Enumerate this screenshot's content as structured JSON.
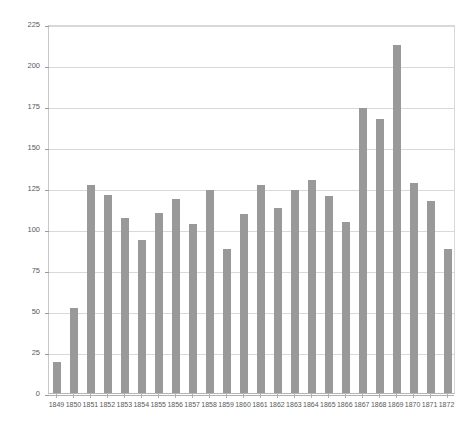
{
  "chart_data": {
    "type": "bar",
    "title": "",
    "subtitle": "",
    "xlabel": "",
    "ylabel": "",
    "categories": [
      "1849",
      "1850",
      "1851",
      "1852",
      "1853",
      "1854",
      "1855",
      "1856",
      "1857",
      "1858",
      "1859",
      "1860",
      "1861",
      "1862",
      "1863",
      "1864",
      "1865",
      "1866",
      "1867",
      "1868",
      "1869",
      "1870",
      "1871",
      "1872"
    ],
    "values": [
      19,
      52,
      127,
      121,
      107,
      93,
      110,
      118,
      103,
      124,
      88,
      109,
      127,
      113,
      124,
      130,
      120,
      104,
      174,
      167,
      212,
      128,
      117,
      88
    ],
    "series": [
      {
        "name": "",
        "values": [
          19,
          52,
          127,
          121,
          107,
          93,
          110,
          118,
          103,
          124,
          88,
          109,
          127,
          113,
          124,
          130,
          120,
          104,
          174,
          167,
          212,
          128,
          117,
          88
        ]
      }
    ],
    "ylim": [
      0,
      225
    ],
    "yticks": [
      0,
      25,
      50,
      75,
      100,
      125,
      150,
      175,
      200,
      225
    ],
    "ytick_labels": [
      "0",
      "25",
      "50",
      "75",
      "100",
      "125",
      "150",
      "175",
      "200",
      "225"
    ],
    "xtick_labels": [
      "1849",
      "1850",
      "1851",
      "1852",
      "1853",
      "1854",
      "1855",
      "1856",
      "1857",
      "1858",
      "1859",
      "1860",
      "1861",
      "1862",
      "1863",
      "1864",
      "1865",
      "1866",
      "1867",
      "1868",
      "1869",
      "1870",
      "1871",
      "1872"
    ],
    "grid": true,
    "grid_axis": "y",
    "legend": false,
    "legend_position": "none",
    "bar_color": "#999999",
    "grid_color": "#d9d9d9",
    "axis_color": "#b0b0b0",
    "background_color": "#ffffff",
    "annotations": []
  }
}
